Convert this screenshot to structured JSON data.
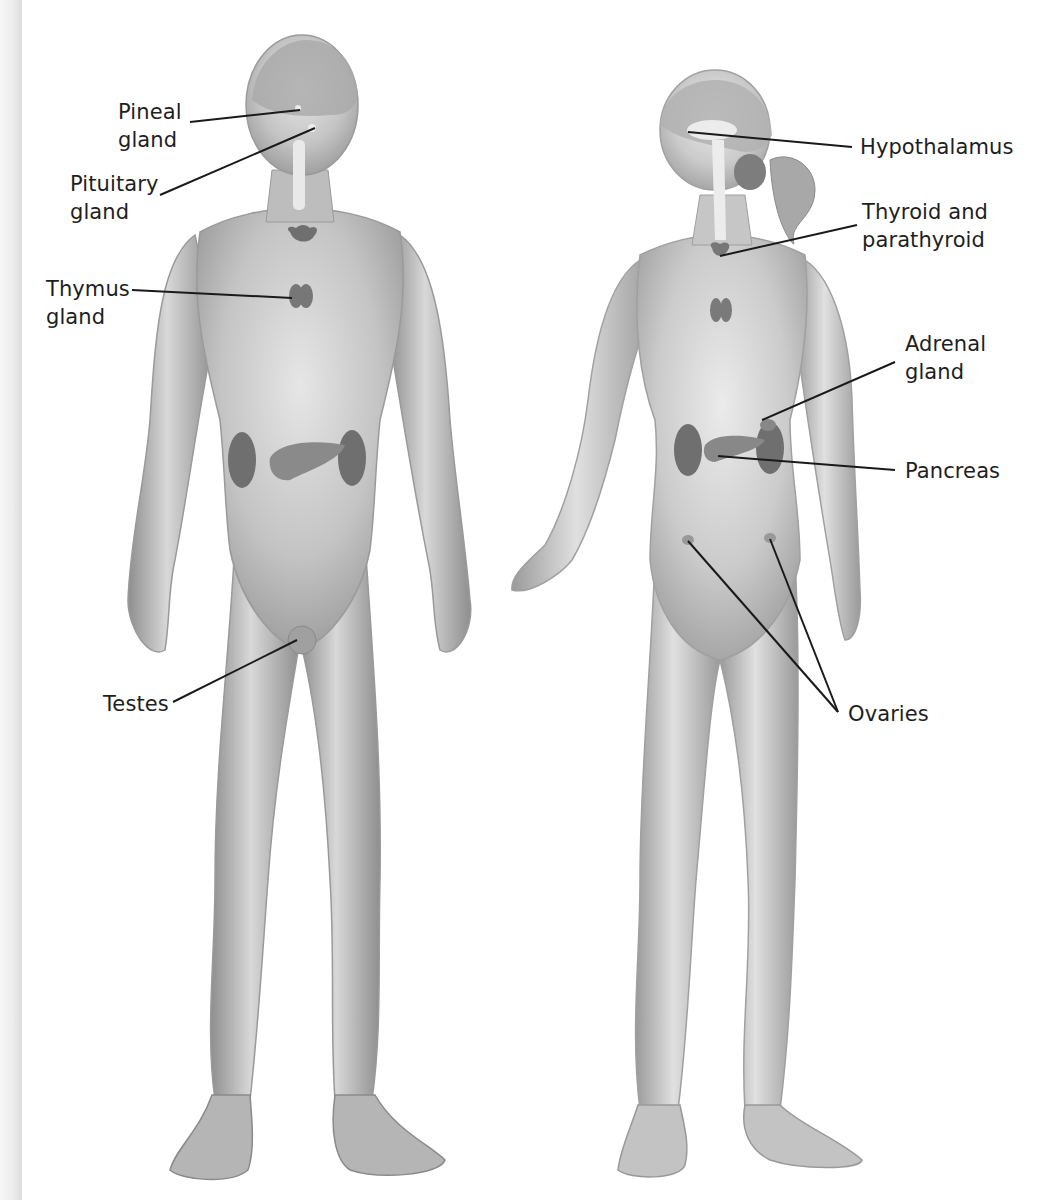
{
  "figure": {
    "male_labels": [
      {
        "id": "pineal",
        "text": "Pineal\ngland"
      },
      {
        "id": "pituitary",
        "text": "Pituitary\ngland"
      },
      {
        "id": "thymus",
        "text": "Thymus\ngland"
      },
      {
        "id": "testes",
        "text": "Testes"
      }
    ],
    "female_labels": [
      {
        "id": "hypothalamus",
        "text": "Hypothalamus"
      },
      {
        "id": "thyroid",
        "text": "Thyroid and\nparathyroid"
      },
      {
        "id": "adrenal",
        "text": "Adrenal\ngland"
      },
      {
        "id": "pancreas",
        "text": "Pancreas"
      },
      {
        "id": "ovaries",
        "text": "Ovaries"
      }
    ],
    "colors": {
      "skin": "#b9b9b9",
      "skin_light": "#dcdcdc",
      "skin_dark": "#8a8a8a",
      "organ": "#6f6f6f",
      "leader_line": "#1a1a1a",
      "label_text": "#1e1e1e"
    }
  }
}
